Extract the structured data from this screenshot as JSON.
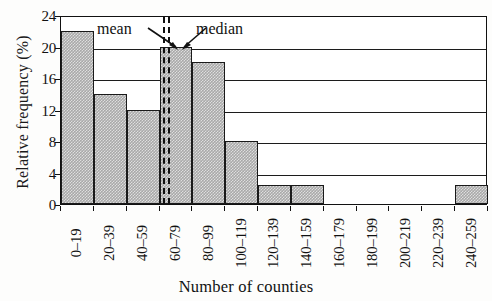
{
  "chart_data": {
    "type": "bar",
    "title": "",
    "xlabel": "Number of counties",
    "ylabel": "Relative frequency (%)",
    "categories": [
      "0–19",
      "20–39",
      "40–59",
      "60–79",
      "80–99",
      "100–119",
      "120–139",
      "140–159",
      "160–179",
      "180–199",
      "200–219",
      "220–239",
      "240–259"
    ],
    "values": [
      22,
      14,
      12,
      20,
      18,
      8,
      2.4,
      2.4,
      0,
      0,
      0,
      0,
      2.4
    ],
    "ylim": [
      0,
      24
    ],
    "yticks": [
      0,
      4,
      8,
      12,
      16,
      20,
      24
    ],
    "ytick_labels": [
      "0",
      "4",
      "8",
      "12",
      "16",
      "20",
      "24"
    ],
    "grid": "horizontal",
    "legend": "none",
    "bar_color": "#a9a9a9",
    "bar_edge_color": "#1a1a1a",
    "annotations": [
      {
        "label": "mean",
        "at_category": "60–79",
        "style": "dashed-vertical"
      },
      {
        "label": "median",
        "at_category": "60–79",
        "style": "dashed-vertical"
      }
    ]
  },
  "annotations": {
    "mean_label": "mean",
    "median_label": "median"
  },
  "axes": {
    "y_title": "Relative frequency (%)",
    "x_title": "Number of counties"
  }
}
